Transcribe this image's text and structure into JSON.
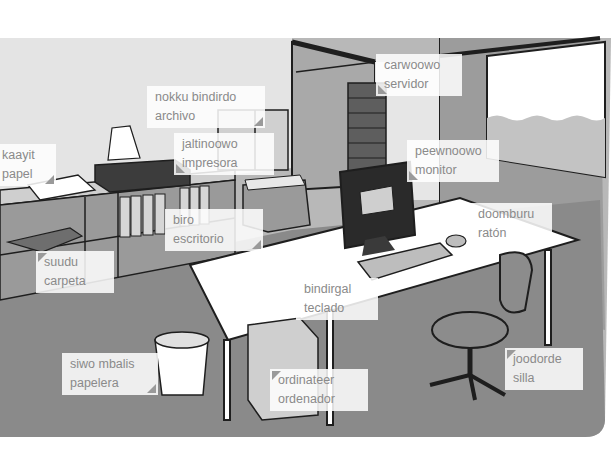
{
  "scene": {
    "title": "Office vocabulary illustration",
    "colors": {
      "wall": "#bcbcbc",
      "floor": "#8c8c8c",
      "back_wall_light": "#e8e8e8",
      "desk": "#ffffff",
      "outline": "#1e1e1e",
      "label_text": "#8a8a8a"
    }
  },
  "labels": [
    {
      "id": "server",
      "term": "carwoowo",
      "translation": "servidor"
    },
    {
      "id": "file-cabinet",
      "term": "nokku bindirdo",
      "translation": "archivo"
    },
    {
      "id": "printer",
      "term": "jaltinoowo",
      "translation": "impresora"
    },
    {
      "id": "paper",
      "term": "kaayit",
      "translation": "papel"
    },
    {
      "id": "monitor",
      "term": "peewnoowo",
      "translation": "monitor"
    },
    {
      "id": "mouse",
      "term": "doomburu",
      "translation": "ratón"
    },
    {
      "id": "desk",
      "term": "biro",
      "translation": "escritorio"
    },
    {
      "id": "folder",
      "term": "suudu",
      "translation": "carpeta"
    },
    {
      "id": "keyboard",
      "term": "bindirgal",
      "translation": "teclado"
    },
    {
      "id": "wastebasket",
      "term": "siwo mbalis",
      "translation": "papelera"
    },
    {
      "id": "computer",
      "term": "ordinateer",
      "translation": "ordenador"
    },
    {
      "id": "chair",
      "term": "joodorde",
      "translation": "silla"
    }
  ]
}
